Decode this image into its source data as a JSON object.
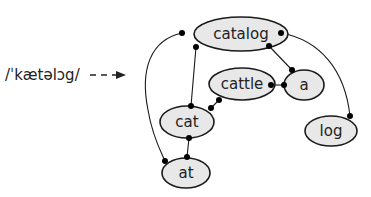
{
  "diagram": {
    "pronunciation": "/ˈkætəlɔg/",
    "arrow": "dashed-right-arrow",
    "nodes": [
      {
        "id": "catalog",
        "label": "catalog",
        "cx": 241,
        "cy": 34,
        "rx": 47,
        "ry": 17
      },
      {
        "id": "cattle",
        "label": "cattle",
        "cx": 242,
        "cy": 84,
        "rx": 33,
        "ry": 16
      },
      {
        "id": "a",
        "label": "a",
        "cx": 304,
        "cy": 85,
        "rx": 20,
        "ry": 15
      },
      {
        "id": "cat",
        "label": "cat",
        "cx": 187,
        "cy": 122,
        "rx": 27,
        "ry": 16
      },
      {
        "id": "log",
        "label": "log",
        "cx": 331,
        "cy": 131,
        "rx": 26,
        "ry": 15
      },
      {
        "id": "at",
        "label": "at",
        "cx": 186,
        "cy": 173,
        "rx": 24,
        "ry": 15
      }
    ],
    "edges": [
      {
        "from": "catalog",
        "to": "cat"
      },
      {
        "from": "catalog",
        "to": "a"
      },
      {
        "from": "catalog",
        "to": "at"
      },
      {
        "from": "catalog",
        "to": "log"
      },
      {
        "from": "cattle",
        "to": "a"
      },
      {
        "from": "cattle",
        "to": "cat"
      },
      {
        "from": "cat",
        "to": "at"
      }
    ],
    "colors": {
      "node_fill": "#e8e8e8",
      "node_stroke": "#1a1a1a",
      "edge": "#1a1a1a",
      "text": "#222222"
    }
  }
}
